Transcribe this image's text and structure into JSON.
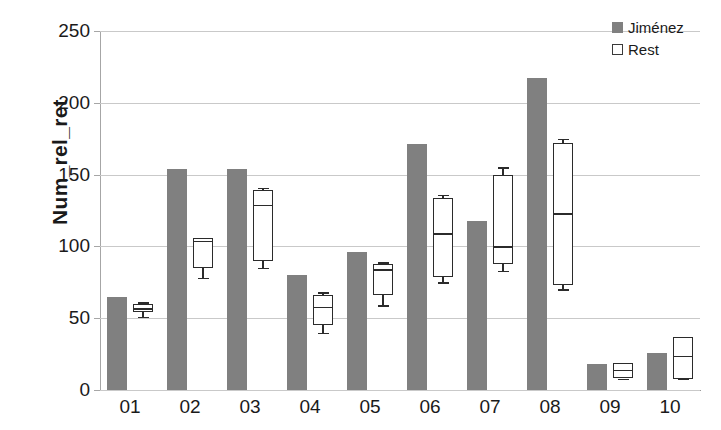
{
  "chart_data": {
    "type": "bar",
    "title": "",
    "xlabel": "",
    "ylabel": "Num_rel_ret",
    "ylim": [
      0,
      250
    ],
    "ytick_step": 50,
    "yticks": [
      "0",
      "50",
      "100",
      "150",
      "200",
      "250"
    ],
    "grid": true,
    "legend_position": "top-right",
    "categories": [
      "01",
      "02",
      "03",
      "04",
      "05",
      "06",
      "07",
      "08",
      "09",
      "10"
    ],
    "series": [
      {
        "name": "Jimenez",
        "label": "Jiménez",
        "kind": "bar",
        "color": "#808080",
        "values": [
          65,
          154,
          154,
          80,
          96,
          171,
          118,
          217,
          18,
          26
        ]
      },
      {
        "name": "Rest",
        "label": "Rest",
        "kind": "boxplot",
        "color": "#ffffff",
        "edge_color": "#2b2b2b",
        "boxes": [
          {
            "category": "01",
            "whisker_low": 51,
            "q1": 54,
            "median": 57,
            "q3": 60,
            "whisker_high": 61
          },
          {
            "category": "02",
            "whisker_low": 78,
            "q1": 85,
            "median": 104,
            "q3": 106,
            "whisker_high": 106
          },
          {
            "category": "03",
            "whisker_low": 85,
            "q1": 90,
            "median": 129,
            "q3": 139,
            "whisker_high": 141
          },
          {
            "category": "04",
            "whisker_low": 40,
            "q1": 45,
            "median": 58,
            "q3": 66,
            "whisker_high": 68
          },
          {
            "category": "05",
            "whisker_low": 59,
            "q1": 66,
            "median": 84,
            "q3": 88,
            "whisker_high": 89
          },
          {
            "category": "06",
            "whisker_low": 75,
            "q1": 79,
            "median": 109,
            "q3": 134,
            "whisker_high": 136
          },
          {
            "category": "07",
            "whisker_low": 83,
            "q1": 88,
            "median": 100,
            "q3": 150,
            "whisker_high": 155
          },
          {
            "category": "08",
            "whisker_low": 70,
            "q1": 73,
            "median": 123,
            "q3": 172,
            "whisker_high": 175
          },
          {
            "category": "09",
            "whisker_low": 8,
            "q1": 8,
            "median": 14,
            "q3": 19,
            "whisker_high": 19
          },
          {
            "category": "10",
            "whisker_low": 8,
            "q1": 8,
            "median": 24,
            "q3": 37,
            "whisker_high": 37
          }
        ]
      }
    ]
  },
  "legend": {
    "items": [
      {
        "label": "Jiménez",
        "swatch": "filled"
      },
      {
        "label": "Rest",
        "swatch": "outline"
      }
    ]
  },
  "colors": {
    "bar_gray": "#808080",
    "box_edge": "#2b2b2b",
    "gridline": "#c9c9c9",
    "axis": "#9a9a9a",
    "text": "#1a1a1a",
    "background": "#ffffff"
  }
}
